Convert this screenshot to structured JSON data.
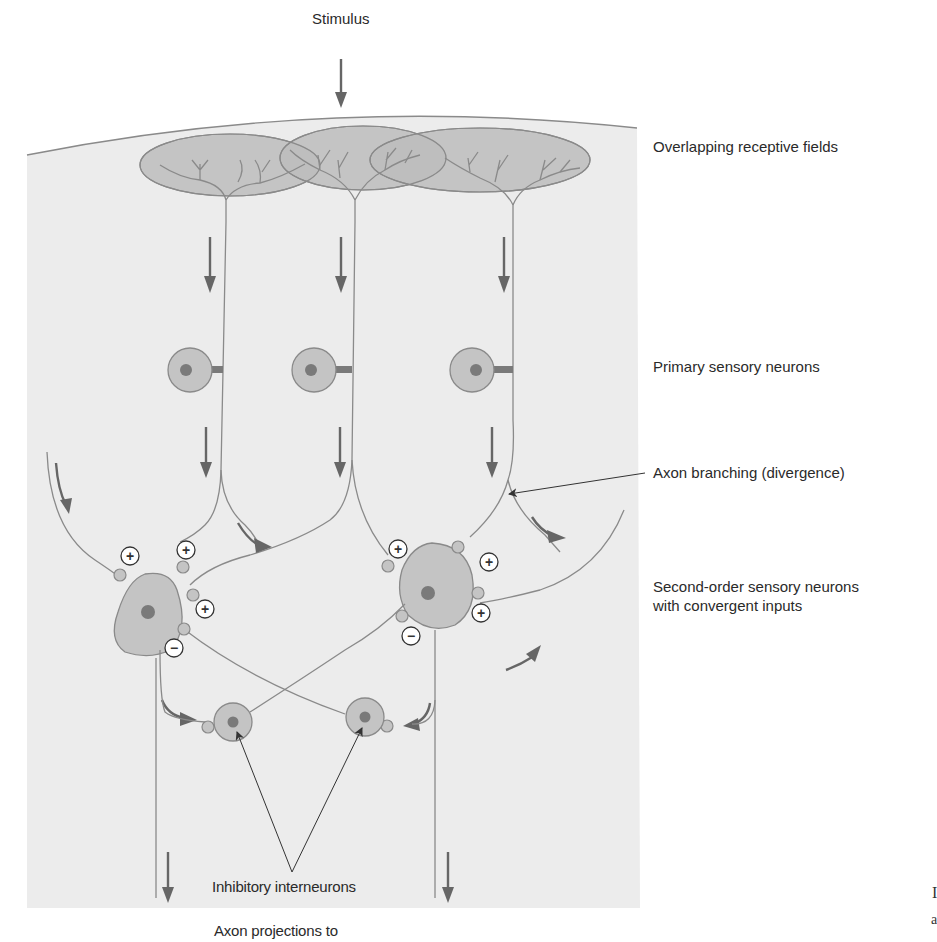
{
  "figure": {
    "title_top": "Stimulus",
    "labels": {
      "receptive_fields": "Overlapping receptive fields",
      "primary_neurons": "Primary sensory neurons",
      "axon_branching": "Axon branching (divergence)",
      "second_order_line1": "Second-order sensory neurons",
      "second_order_line2": "with convergent inputs",
      "inhibitory": "Inhibitory interneurons",
      "axon_projections": "Axon projections to"
    },
    "synapse_signs": {
      "excitatory": "+",
      "inhibitory": "−"
    },
    "cropped_edge_glyphs": [
      "I",
      "a"
    ],
    "colors": {
      "panel": "#ececec",
      "receptive_field": "#bdbdbd",
      "cell_body": "#c4c4c4",
      "nucleus": "#7a7a7a",
      "line": "#8a8a8a",
      "arrow": "#666666",
      "text": "#2a2a2a"
    }
  }
}
